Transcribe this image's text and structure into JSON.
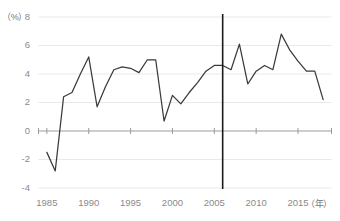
{
  "chart_data": {
    "type": "line",
    "title": "",
    "xlabel": "（年）",
    "ylabel": "（%）",
    "x": [
      1985,
      1986,
      1987,
      1988,
      1989,
      1990,
      1991,
      1992,
      1993,
      1994,
      1995,
      1996,
      1997,
      1998,
      1999,
      2000,
      2001,
      2002,
      2003,
      2004,
      2005,
      2006,
      2007,
      2008,
      2009,
      2010,
      2011,
      2012,
      2013,
      2014,
      2015,
      2016,
      2017,
      2018
    ],
    "values": [
      -1.5,
      -2.8,
      2.4,
      2.7,
      4.0,
      5.2,
      3.4,
      1.7,
      2.9,
      4.2,
      4.4,
      4.3,
      4.0,
      4.4,
      4.8,
      5.0,
      0.7,
      2.5,
      1.9,
      2.4,
      2.7,
      3.2,
      3.7,
      4.3,
      4.6,
      4.6,
      4.3,
      3.3,
      4.2,
      4.6,
      5.0,
      4.2,
      4.2,
      2.2
    ],
    "series": [
      {
        "name": "系列1",
        "points": [
          {
            "year": 1985,
            "value": -1.5
          },
          {
            "year": 1986,
            "value": -2.8
          },
          {
            "year": 1987,
            "value": 2.4
          },
          {
            "year": 1988,
            "value": 2.7
          },
          {
            "year": 1989,
            "value": 4.0
          },
          {
            "year": 1990,
            "value": 5.2
          },
          {
            "year": 1991,
            "value": 1.7
          },
          {
            "year": 1992,
            "value": 3.1
          },
          {
            "year": 1993,
            "value": 4.3
          },
          {
            "year": 1994,
            "value": 4.5
          },
          {
            "year": 1995,
            "value": 4.4
          },
          {
            "year": 1996,
            "value": 4.1
          },
          {
            "year": 1997,
            "value": 5.0
          },
          {
            "year": 1998,
            "value": 5.0
          },
          {
            "year": 1999,
            "value": 0.7
          },
          {
            "year": 2000,
            "value": 2.5
          },
          {
            "year": 2001,
            "value": 1.9
          },
          {
            "year": 2002,
            "value": 2.7
          },
          {
            "year": 2003,
            "value": 3.4
          },
          {
            "year": 2004,
            "value": 4.2
          },
          {
            "year": 2005,
            "value": 4.6
          },
          {
            "year": 2006,
            "value": 4.6
          },
          {
            "year": 2007,
            "value": 4.3
          },
          {
            "year": 2008,
            "value": 6.1
          },
          {
            "year": 2009,
            "value": 3.3
          },
          {
            "year": 2010,
            "value": 4.2
          },
          {
            "year": 2011,
            "value": 4.6
          },
          {
            "year": 2012,
            "value": 4.3
          },
          {
            "year": 2013,
            "value": 6.8
          },
          {
            "year": 2014,
            "value": 5.7
          },
          {
            "year": 2015,
            "value": 4.9
          },
          {
            "year": 2016,
            "value": 4.2
          },
          {
            "year": 2017,
            "value": 4.2
          },
          {
            "year": 2018,
            "value": 2.2
          }
        ]
      }
    ],
    "y_ticks": [
      "8",
      "6",
      "4",
      "2",
      "0",
      "-2",
      "-4"
    ],
    "y_tick_values": [
      8,
      6,
      4,
      2,
      0,
      -2,
      -4
    ],
    "ylim": [
      -4,
      8
    ],
    "x_ticks": [
      "1985",
      "1990",
      "1995",
      "2000",
      "2005",
      "2010",
      "2015"
    ],
    "x_tick_values": [
      1985,
      1990,
      1995,
      2000,
      2005,
      2010,
      2015
    ],
    "xlim": [
      1984,
      2019
    ],
    "grid": true,
    "legend": "none",
    "annotations": [
      {
        "name": "vertical-marker",
        "x_value": 2006,
        "label": ""
      }
    ],
    "colors": {
      "line": "#3a3a3a",
      "grid": "#e9e9e9",
      "axis": "#9b9b9b",
      "marker": "#1a1a1a",
      "tick_label": "#8a8a8a"
    }
  }
}
